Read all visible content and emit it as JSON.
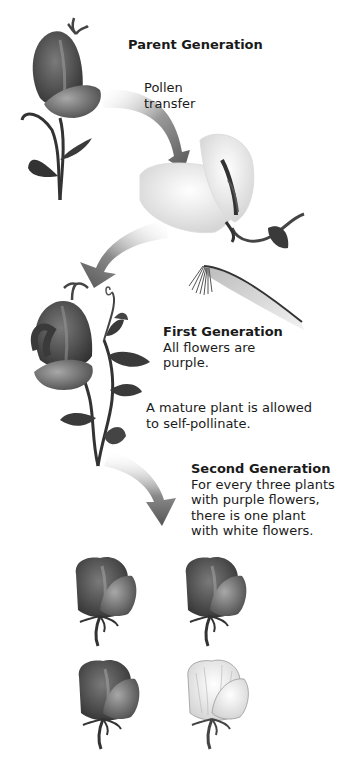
{
  "diagram": {
    "parent_generation": {
      "title": "Parent Generation",
      "step_label_line1": "Pollen",
      "step_label_line2": "transfer"
    },
    "first_generation": {
      "title": "First Generation",
      "desc_line1": "All flowers are",
      "desc_line2": "purple."
    },
    "self_pollinate": {
      "line1": "A mature plant is allowed",
      "line2": "to self-pollinate."
    },
    "second_generation": {
      "title": "Second Generation",
      "desc_line1": "For every three plants",
      "desc_line2": "with purple flowers,",
      "desc_line3": "there is one plant",
      "desc_line4": "with white flowers."
    },
    "offspring": [
      {
        "color": "purple"
      },
      {
        "color": "purple"
      },
      {
        "color": "purple"
      },
      {
        "color": "white"
      }
    ],
    "colors": {
      "purple_flower": "#4a4a4a",
      "white_flower": "#e8e8e8",
      "arrow": "#6a6a6a",
      "text": "#1a1a1a"
    }
  }
}
